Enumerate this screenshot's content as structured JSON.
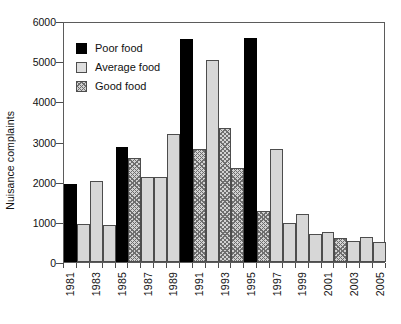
{
  "chart_data": {
    "type": "bar",
    "title": "",
    "xlabel": "",
    "ylabel": "Nuisance complaints",
    "ylim": [
      0,
      6000
    ],
    "ytick_values": [
      0,
      1000,
      2000,
      3000,
      4000,
      5000,
      6000
    ],
    "ytick_labels": [
      "0",
      "1000",
      "2000",
      "3000",
      "4000",
      "5000",
      "6000"
    ],
    "grid": false,
    "legend_position": "upper-left",
    "categories": [
      "1981",
      "1982",
      "1983",
      "1984",
      "1985",
      "1986",
      "1987",
      "1988",
      "1989",
      "1990",
      "1991",
      "1992",
      "1993",
      "1994",
      "1995",
      "1996",
      "1997",
      "1998",
      "1999",
      "2000",
      "2001",
      "2002",
      "2003",
      "2004",
      "2005"
    ],
    "xtick_labels": [
      "1981",
      "1983",
      "1985",
      "1987",
      "1989",
      "1991",
      "1993",
      "1995",
      "1997",
      "1999",
      "2001",
      "2003",
      "2005"
    ],
    "legend_entries": [
      {
        "label": "Poor food",
        "key": "poor",
        "color": "#000000"
      },
      {
        "label": "Average food",
        "key": "average",
        "color": "#d7d7d7"
      },
      {
        "label": "Good food",
        "key": "good",
        "color": "#d2d2d2"
      }
    ],
    "bars": [
      {
        "category": "1981",
        "value": 1950,
        "series": "poor"
      },
      {
        "category": "1982",
        "value": 950,
        "series": "average"
      },
      {
        "category": "1983",
        "value": 2020,
        "series": "average"
      },
      {
        "category": "1984",
        "value": 930,
        "series": "average"
      },
      {
        "category": "1985",
        "value": 2870,
        "series": "poor"
      },
      {
        "category": "1986",
        "value": 2580,
        "series": "good"
      },
      {
        "category": "1987",
        "value": 2110,
        "series": "average"
      },
      {
        "category": "1988",
        "value": 2120,
        "series": "average"
      },
      {
        "category": "1989",
        "value": 3180,
        "series": "average"
      },
      {
        "category": "1990",
        "value": 5560,
        "series": "poor"
      },
      {
        "category": "1991",
        "value": 2820,
        "series": "good"
      },
      {
        "category": "1992",
        "value": 5020,
        "series": "average"
      },
      {
        "category": "1993",
        "value": 3330,
        "series": "good"
      },
      {
        "category": "1994",
        "value": 2350,
        "series": "good"
      },
      {
        "category": "1995",
        "value": 5570,
        "series": "poor"
      },
      {
        "category": "1996",
        "value": 1280,
        "series": "good"
      },
      {
        "category": "1997",
        "value": 2820,
        "series": "average"
      },
      {
        "category": "1998",
        "value": 960,
        "series": "average"
      },
      {
        "category": "1999",
        "value": 1200,
        "series": "average"
      },
      {
        "category": "2000",
        "value": 700,
        "series": "average"
      },
      {
        "category": "2001",
        "value": 740,
        "series": "average"
      },
      {
        "category": "2002",
        "value": 600,
        "series": "good"
      },
      {
        "category": "2003",
        "value": 520,
        "series": "average"
      },
      {
        "category": "2004",
        "value": 620,
        "series": "average"
      },
      {
        "category": "2005",
        "value": 500,
        "series": "average"
      }
    ]
  }
}
